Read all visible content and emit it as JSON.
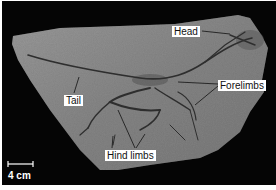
{
  "figure": {
    "background_color": "#050505",
    "slab_color": "#8a8a8a"
  },
  "labels": {
    "head": "Head",
    "forelimbs": "Forelimbs",
    "tail": "Tail",
    "hind_limbs": "Hind limbs"
  },
  "scale_bar": {
    "text": "4 cm"
  }
}
